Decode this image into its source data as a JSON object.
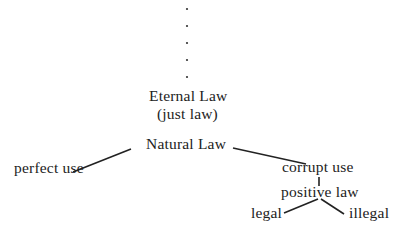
{
  "diagram": {
    "type": "tree",
    "ellipsis_dots": 5,
    "nodes": {
      "eternal": "Eternal Law",
      "eternal_sub": "(just law)",
      "natural": "Natural Law",
      "perfect": "perfect use",
      "corrupt": "corrupt use",
      "positive": "positive law",
      "legal": "legal",
      "illegal": "illegal"
    },
    "edges": [
      [
        "Natural Law",
        "perfect use"
      ],
      [
        "Natural Law",
        "corrupt use"
      ],
      [
        "corrupt use",
        "positive law"
      ],
      [
        "positive law",
        "legal"
      ],
      [
        "positive law",
        "illegal"
      ]
    ]
  }
}
